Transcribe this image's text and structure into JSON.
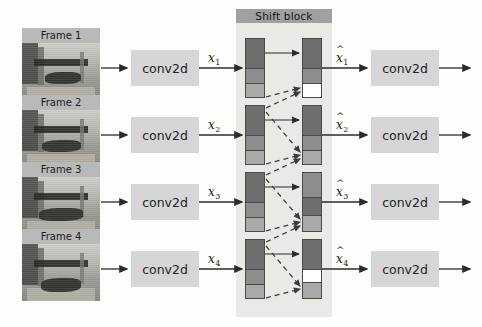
{
  "diagram": {
    "shift_block_label": "Shift block",
    "colors": {
      "block_fill": "#d6d6d6",
      "shift_block_bg": "#e9e9e6",
      "shift_header_bg": "#a0a0a0",
      "frame_label_bg": "#b9b9b9",
      "seg_dark": "#6e6e6e",
      "seg_mid": "#8d8d8d",
      "seg_light": "#a9a9a9",
      "seg_empty": "#ffffff",
      "arrow": "#2b2b2b",
      "dashed_arrow": "#555555"
    }
  },
  "frames": [
    {
      "label": "Frame 1"
    },
    {
      "label": "Frame 2"
    },
    {
      "label": "Frame 3"
    },
    {
      "label": "Frame 4"
    }
  ],
  "conv_left": [
    {
      "label": "conv2d"
    },
    {
      "label": "conv2d"
    },
    {
      "label": "conv2d"
    },
    {
      "label": "conv2d"
    }
  ],
  "conv_right": [
    {
      "label": "conv2d"
    },
    {
      "label": "conv2d"
    },
    {
      "label": "conv2d"
    },
    {
      "label": "conv2d"
    }
  ],
  "feature_labels_in": [
    {
      "base": "x",
      "sub": "1"
    },
    {
      "base": "x",
      "sub": "2"
    },
    {
      "base": "x",
      "sub": "3"
    },
    {
      "base": "x",
      "sub": "4"
    }
  ],
  "feature_labels_out": [
    {
      "base": "x",
      "sub": "1",
      "hat": "^"
    },
    {
      "base": "x",
      "sub": "2",
      "hat": "^"
    },
    {
      "base": "x",
      "sub": "3",
      "hat": "^"
    },
    {
      "base": "x",
      "sub": "4",
      "hat": "^"
    }
  ],
  "shift_bars_left": [
    {
      "segments": [
        "seg_dark",
        "seg_mid",
        "seg_light"
      ]
    },
    {
      "segments": [
        "seg_dark",
        "seg_mid",
        "seg_light"
      ]
    },
    {
      "segments": [
        "seg_dark",
        "seg_mid",
        "seg_light"
      ]
    },
    {
      "segments": [
        "seg_dark",
        "seg_mid",
        "seg_light"
      ]
    }
  ],
  "shift_bars_right": [
    {
      "segments": [
        "seg_dark",
        "seg_mid",
        "seg_empty"
      ]
    },
    {
      "segments": [
        "seg_dark",
        "seg_mid",
        "seg_light"
      ]
    },
    {
      "segments": [
        "seg_mid",
        "seg_dark",
        "seg_light"
      ]
    },
    {
      "segments": [
        "seg_dark",
        "seg_empty",
        "seg_light"
      ]
    }
  ]
}
